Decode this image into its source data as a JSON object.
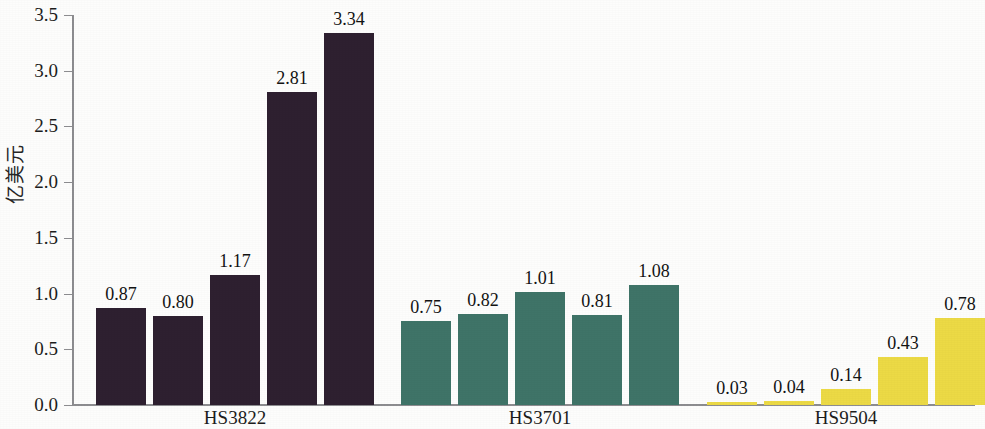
{
  "chart_data": {
    "type": "bar",
    "title": "",
    "subtitle": "",
    "xlabel": "",
    "ylabel": "亿美元",
    "ylim": [
      0.0,
      3.5
    ],
    "ytick_labels": [
      "3.5",
      "3.0",
      "2.5",
      "2.0",
      "1.5",
      "1.0",
      "0.5",
      "0.0"
    ],
    "ytick_values": [
      3.5,
      3.0,
      2.5,
      2.0,
      1.5,
      1.0,
      0.5,
      0.0
    ],
    "grid": false,
    "legend": "none",
    "categories": [
      "HS3822",
      "HS3701",
      "HS9504"
    ],
    "groups": [
      {
        "label": "HS3822",
        "color": "#2e2030",
        "values": [
          0.87,
          0.8,
          1.17,
          2.81,
          3.34
        ],
        "value_labels": [
          "0.87",
          "0.80",
          "1.17",
          "2.81",
          "3.34"
        ]
      },
      {
        "label": "HS3701",
        "color": "#3f7468",
        "values": [
          0.75,
          0.82,
          1.01,
          0.81,
          1.08
        ],
        "value_labels": [
          "0.75",
          "0.82",
          "1.01",
          "0.81",
          "1.08"
        ]
      },
      {
        "label": "HS9504",
        "color": "#ecda45",
        "values": [
          0.03,
          0.04,
          0.14,
          0.43,
          0.78
        ],
        "value_labels": [
          "0.03",
          "0.04",
          "0.14",
          "0.43",
          "0.78"
        ]
      }
    ]
  },
  "colors": {
    "group_hs3822": "#2e2030",
    "group_hs3701": "#3f7468",
    "group_hs9504": "#ecda45",
    "axis": "#8d8d90",
    "text": "#1a1a1a",
    "background": "#fdfdfc"
  },
  "layout": {
    "baseline_y": 405,
    "axis_left_x": 72,
    "axis_right_x": 975,
    "y_top_value": 3.5,
    "y_top_y": 15,
    "bar_width": 50,
    "bar_gap": 7,
    "group_gap": 43,
    "group_start_x": [
      96,
      401,
      707
    ]
  }
}
